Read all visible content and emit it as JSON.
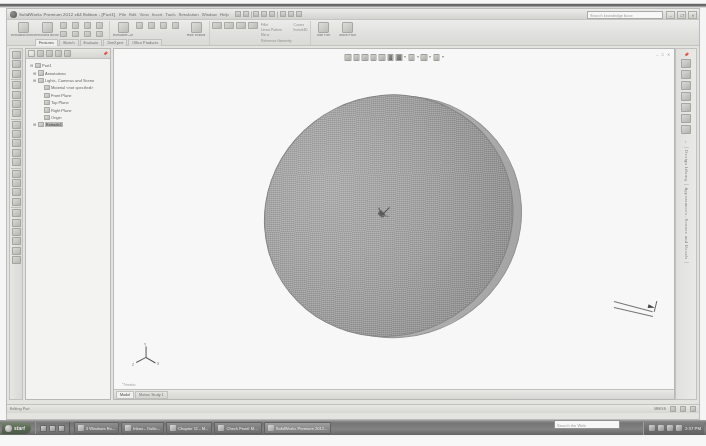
{
  "window": {
    "title": "SolidWorks Premium 2012 x64 Edition - [Part1]",
    "logo_icon": "solidworks-logo-icon",
    "search_placeholder": "Search knowledge base",
    "controls": [
      {
        "name": "minimize-button",
        "glyph": "–"
      },
      {
        "name": "restore-button",
        "glyph": "❐"
      },
      {
        "name": "close-button",
        "glyph": "✕"
      }
    ]
  },
  "menubar": {
    "items": [
      "File",
      "Edit",
      "View",
      "Insert",
      "Tools",
      "Simulation",
      "Window",
      "Help"
    ]
  },
  "quick_access": {
    "items": [
      "new-document-icon",
      "open-document-icon",
      "save-icon",
      "print-icon",
      "undo-icon",
      "redo-icon",
      "rebuild-icon",
      "options-icon"
    ]
  },
  "ribbon": {
    "tabs": [
      {
        "label": "Features",
        "active": true
      },
      {
        "label": "Sketch",
        "active": false
      },
      {
        "label": "Evaluate",
        "active": false
      },
      {
        "label": "DimXpert",
        "active": false
      },
      {
        "label": "Office Products",
        "active": false
      }
    ],
    "groups": [
      {
        "name": "boss-base-group",
        "big_buttons": [
          {
            "label": "Extruded Boss/Base",
            "icon": "extruded-boss-icon"
          },
          {
            "label": "Revolved Boss/Base",
            "icon": "revolved-boss-icon"
          }
        ],
        "small_icons": [
          "swept-boss-icon",
          "lofted-boss-icon",
          "boundary-boss-icon",
          "rib-icon",
          "draft-icon",
          "shell-icon"
        ]
      },
      {
        "name": "cut-group",
        "big_buttons": [
          {
            "label": "Extruded Cut",
            "icon": "extruded-cut-icon"
          },
          {
            "label": "Hole Wizard",
            "icon": "hole-wizard-icon"
          }
        ],
        "small_icons": [
          "revolved-cut-icon",
          "swept-cut-icon",
          "lofted-cut-icon",
          "boundary-cut-icon"
        ]
      },
      {
        "name": "pattern-group",
        "labels": [
          "Fillet",
          "Linear Pattern",
          "Mirror",
          "Reference Geometry",
          "Curves",
          "Instant3D"
        ]
      },
      {
        "name": "eval-group",
        "big_buttons": [
          {
            "label": "Edit Part",
            "icon": "edit-part-icon"
          },
          {
            "label": "Move Face",
            "icon": "move-face-icon"
          }
        ]
      }
    ]
  },
  "left_toolbar": {
    "items": [
      "select-icon",
      "zoom-to-fit-icon",
      "zoom-area-icon",
      "rotate-view-icon",
      "pan-icon",
      "previous-view-icon",
      "section-view-icon",
      "view-orientation-icon",
      "display-style-icon",
      "hide-show-icon",
      "edit-appearance-icon",
      "apply-scene-icon",
      "view-setting-icon",
      "wireframe-icon",
      "shaded-icon",
      "shaded-edges-icon",
      "hidden-lines-icon",
      "perspective-icon",
      "shadows-icon",
      "measure-icon",
      "mass-properties-icon",
      "check-icon",
      "sensor-icon",
      "screen-capture-icon"
    ]
  },
  "feature_manager": {
    "tabs": [
      "feature-manager-tab",
      "property-manager-tab",
      "configuration-manager-tab",
      "dimxpert-manager-tab",
      "display-manager-tab"
    ],
    "pin_icon": "auto-hide-pin-icon",
    "tree": [
      {
        "label": "Part1",
        "icon": "part-icon",
        "level": 0,
        "twisty": "⊟",
        "selected": false
      },
      {
        "label": "Annotations",
        "icon": "annotations-icon",
        "level": 1,
        "twisty": "⊞",
        "selected": false
      },
      {
        "label": "Lights, Cameras and Scene",
        "icon": "lights-icon",
        "level": 1,
        "twisty": "⊞",
        "selected": false
      },
      {
        "label": "Material <not specified>",
        "icon": "material-icon",
        "level": 1,
        "twisty": "",
        "selected": false
      },
      {
        "label": "Front Plane",
        "icon": "plane-icon",
        "level": 1,
        "twisty": "",
        "selected": false
      },
      {
        "label": "Top Plane",
        "icon": "plane-icon",
        "level": 1,
        "twisty": "",
        "selected": false
      },
      {
        "label": "Right Plane",
        "icon": "plane-icon",
        "level": 1,
        "twisty": "",
        "selected": false
      },
      {
        "label": "Origin",
        "icon": "origin-icon",
        "level": 1,
        "twisty": "",
        "selected": false
      },
      {
        "label": "Extrude1",
        "icon": "extrude-feature-icon",
        "level": 1,
        "twisty": "⊞",
        "selected": true
      }
    ]
  },
  "graphics": {
    "hud_toolbar": [
      "zoom-to-fit-icon",
      "zoom-area-icon",
      "previous-view-icon",
      "section-view-icon",
      "view-orientation-icon",
      "display-style-icon",
      "hide-show-icon",
      "edit-appearance-icon",
      "apply-scene-icon",
      "view-settings-icon"
    ],
    "window_controls": "– □ ✕",
    "part": {
      "name": "cylindrical-disc-part",
      "shading": "#a2a2a2",
      "edge_color": "#7e7e7e"
    },
    "triad": {
      "x": "X",
      "y": "Y",
      "z": "Z",
      "caption": "*Trimetric"
    },
    "doc_tabs": [
      {
        "label": "Model",
        "active": true
      },
      {
        "label": "Motion Study 1",
        "active": false
      }
    ]
  },
  "right_pane": {
    "icons": [
      "solidworks-resources-icon",
      "design-library-icon",
      "file-explorer-icon",
      "search-icon",
      "view-palette-icon",
      "appearances-icon",
      "custom-properties-icon"
    ],
    "label": "← │ Design Library │ Appearances, Scenes and Decals │",
    "pin_icon": "auto-hide-pin-icon"
  },
  "statusbar": {
    "message": "Editing Part",
    "units": "MMGS",
    "icons": [
      "rebuild-status-icon",
      "units-icon",
      "overlay-icon"
    ]
  },
  "taskbar": {
    "start_label": "start",
    "start_icon": "windows-orb-icon",
    "quick_launch": [
      "show-desktop-icon",
      "internet-explorer-icon",
      "media-player-icon"
    ],
    "tasks": [
      {
        "label": "3 Windows Ex...",
        "icon": "explorer-icon",
        "active": false
      },
      {
        "label": "Inbox - Outlo...",
        "icon": "outlook-icon",
        "active": false
      },
      {
        "label": "Chapter 11 - M...",
        "icon": "word-icon",
        "active": false
      },
      {
        "label": "Check Feed: M...",
        "icon": "browser-icon",
        "active": false
      },
      {
        "label": "SolidWorks Premium 2012...",
        "icon": "solidworks-icon",
        "active": true
      }
    ],
    "tray_search_placeholder": "Search the Web",
    "tray_icons": [
      "network-icon",
      "volume-icon",
      "antivirus-icon",
      "update-icon"
    ],
    "clock": "2:37 PM"
  }
}
